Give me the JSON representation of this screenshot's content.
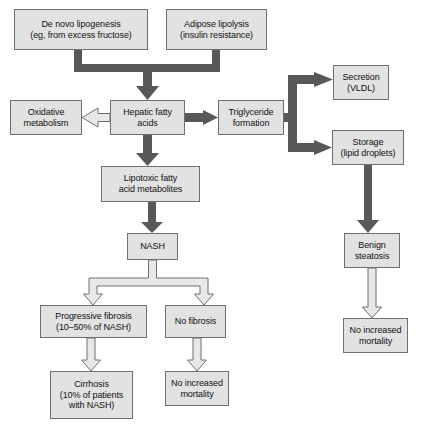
{
  "diagram": {
    "colors": {
      "node_fill": "#e2e2e2",
      "node_border": "#6f6f6f",
      "solid_arrow": "#57585a",
      "hollow_arrow_fill": "#e8e8e8",
      "background": "#ffffff"
    },
    "nodes": [
      {
        "id": "de-novo-lipogenesis",
        "lines": [
          "De novo lipogenesis",
          "(eg, from excess fructose)"
        ],
        "x": 14,
        "y": 9,
        "w": 134,
        "h": 41
      },
      {
        "id": "adipose-lipolysis",
        "lines": [
          "Adipose lipolysis",
          "(insulin resistance)"
        ],
        "x": 166,
        "y": 9,
        "w": 101,
        "h": 41
      },
      {
        "id": "oxidative-metabolism",
        "lines": [
          "Oxidative",
          "metabolism"
        ],
        "x": 10,
        "y": 100,
        "w": 72,
        "h": 35
      },
      {
        "id": "hepatic-fatty-acids",
        "lines": [
          "Hepatic fatty",
          "acids"
        ],
        "x": 110,
        "y": 100,
        "w": 75,
        "h": 35
      },
      {
        "id": "triglyceride-formation",
        "lines": [
          "Triglyceride",
          "formation"
        ],
        "x": 218,
        "y": 100,
        "w": 66,
        "h": 35
      },
      {
        "id": "secretion-vldl",
        "lines": [
          "Secretion",
          "(VLDL)"
        ],
        "x": 333,
        "y": 65,
        "w": 56,
        "h": 35
      },
      {
        "id": "storage-lipid-droplets",
        "lines": [
          "Storage",
          "(lipid droplets)"
        ],
        "x": 332,
        "y": 130,
        "w": 72,
        "h": 35
      },
      {
        "id": "lipotoxic-fatty-acid-metabolites",
        "lines": [
          "Lipotoxic fatty",
          "acid metabolites"
        ],
        "x": 101,
        "y": 166,
        "w": 99,
        "h": 36
      },
      {
        "id": "benign-steatosis",
        "lines": [
          "Benign",
          "steatosis"
        ],
        "x": 344,
        "y": 233,
        "w": 56,
        "h": 35
      },
      {
        "id": "nash",
        "lines": [
          "NASH"
        ],
        "x": 127,
        "y": 233,
        "w": 51,
        "h": 27
      },
      {
        "id": "progressive-fibrosis",
        "lines": [
          "Progressive fibrosis",
          "(10–50% of NASH)"
        ],
        "x": 40,
        "y": 305,
        "w": 107,
        "h": 33
      },
      {
        "id": "no-fibrosis",
        "lines": [
          "No fibrosis"
        ],
        "x": 165,
        "y": 305,
        "w": 61,
        "h": 33
      },
      {
        "id": "no-increased-mortality-right",
        "lines": [
          "No increased",
          "mortality"
        ],
        "x": 343,
        "y": 318,
        "w": 65,
        "h": 35
      },
      {
        "id": "cirrhosis",
        "lines": [
          "Cirrhosis",
          "(10% of patients",
          "with NASH)"
        ],
        "x": 50,
        "y": 371,
        "w": 83,
        "h": 48
      },
      {
        "id": "no-increased-mortality-center",
        "lines": [
          "No increased",
          "mortality"
        ],
        "x": 165,
        "y": 371,
        "w": 64,
        "h": 35
      }
    ],
    "edges": [
      {
        "id": "edge-lipogenesis-to-hepatic",
        "from": "de-novo-lipogenesis",
        "to": "hepatic-fatty-acids",
        "style": "solid"
      },
      {
        "id": "edge-lipolysis-to-hepatic",
        "from": "adipose-lipolysis",
        "to": "hepatic-fatty-acids",
        "style": "solid"
      },
      {
        "id": "edge-hepatic-to-oxidative",
        "from": "hepatic-fatty-acids",
        "to": "oxidative-metabolism",
        "style": "hollow"
      },
      {
        "id": "edge-hepatic-to-triglyceride",
        "from": "hepatic-fatty-acids",
        "to": "triglyceride-formation",
        "style": "solid"
      },
      {
        "id": "edge-hepatic-to-lipotoxic",
        "from": "hepatic-fatty-acids",
        "to": "lipotoxic-fatty-acid-metabolites",
        "style": "solid"
      },
      {
        "id": "edge-triglyceride-to-secretion",
        "from": "triglyceride-formation",
        "to": "secretion-vldl",
        "style": "solid"
      },
      {
        "id": "edge-triglyceride-to-storage",
        "from": "triglyceride-formation",
        "to": "storage-lipid-droplets",
        "style": "solid"
      },
      {
        "id": "edge-storage-to-benign",
        "from": "storage-lipid-droplets",
        "to": "benign-steatosis",
        "style": "solid"
      },
      {
        "id": "edge-lipotoxic-to-nash",
        "from": "lipotoxic-fatty-acid-metabolites",
        "to": "nash",
        "style": "solid"
      },
      {
        "id": "edge-nash-to-progressive",
        "from": "nash",
        "to": "progressive-fibrosis",
        "style": "hollow"
      },
      {
        "id": "edge-nash-to-no-fibrosis",
        "from": "nash",
        "to": "no-fibrosis",
        "style": "hollow"
      },
      {
        "id": "edge-progressive-to-cirrhosis",
        "from": "progressive-fibrosis",
        "to": "cirrhosis",
        "style": "hollow"
      },
      {
        "id": "edge-no-fibrosis-to-mortality",
        "from": "no-fibrosis",
        "to": "no-increased-mortality-center",
        "style": "hollow"
      },
      {
        "id": "edge-benign-to-mortality",
        "from": "benign-steatosis",
        "to": "no-increased-mortality-right",
        "style": "hollow"
      }
    ]
  }
}
